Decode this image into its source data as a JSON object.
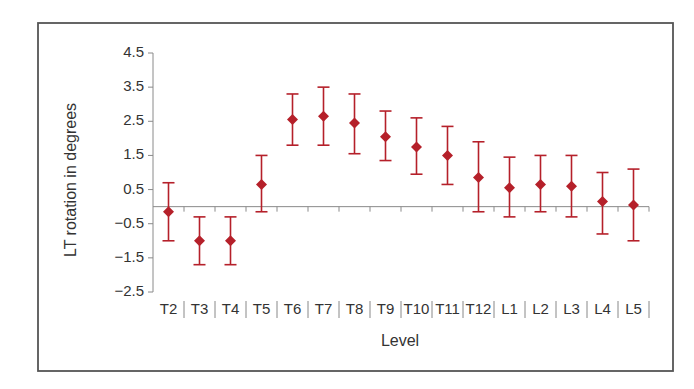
{
  "chart_data": {
    "type": "scatter",
    "subtype": "point_with_error_bars",
    "title": "",
    "xlabel": "Level",
    "ylabel": "LT rotation in degrees",
    "categories": [
      "T2",
      "T3",
      "T4",
      "T5",
      "T6",
      "T7",
      "T8",
      "T9",
      "T10",
      "T11",
      "T12",
      "L1",
      "L2",
      "L3",
      "L4",
      "L5"
    ],
    "series": [
      {
        "name": "LT rotation",
        "color": "#b5202a",
        "marker": "diamond",
        "values": [
          -0.15,
          -1.0,
          -1.0,
          0.65,
          2.55,
          2.65,
          2.45,
          2.05,
          1.75,
          1.5,
          0.85,
          0.55,
          0.65,
          0.6,
          0.15,
          0.05
        ],
        "upper": [
          0.7,
          -0.3,
          -0.3,
          1.5,
          3.3,
          3.5,
          3.3,
          2.8,
          2.6,
          2.35,
          1.9,
          1.45,
          1.5,
          1.5,
          1.0,
          1.1
        ],
        "lower": [
          -1.0,
          -1.7,
          -1.7,
          -0.15,
          1.8,
          1.8,
          1.55,
          1.35,
          0.95,
          0.65,
          -0.15,
          -0.3,
          -0.15,
          -0.3,
          -0.8,
          -1.0
        ]
      }
    ],
    "ylim": [
      -2.5,
      4.5
    ],
    "yticks": [
      4.5,
      3.5,
      2.5,
      1.5,
      0.5,
      -0.5,
      -1.5,
      -2.5
    ],
    "ytick_labels": [
      "4.5",
      "3.5",
      "2.5",
      "1.5",
      "0.5",
      "−0.5",
      "−1.5",
      "−2.5"
    ],
    "grid": false,
    "legend": null,
    "zero_line": true
  }
}
